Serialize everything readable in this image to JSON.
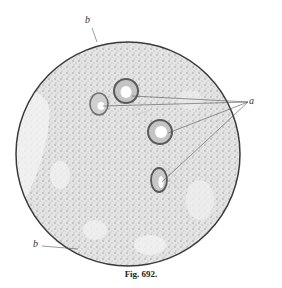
{
  "figure": {
    "caption": "Fig. 692.",
    "labels": [
      {
        "text": "b",
        "position": "top"
      },
      {
        "text": "a",
        "position": "right"
      },
      {
        "text": "b",
        "position": "bottom-left"
      }
    ],
    "colors": {
      "outline": "#3a3a3a",
      "tissue": "#cfcfcf",
      "background": "#ffffff"
    }
  }
}
